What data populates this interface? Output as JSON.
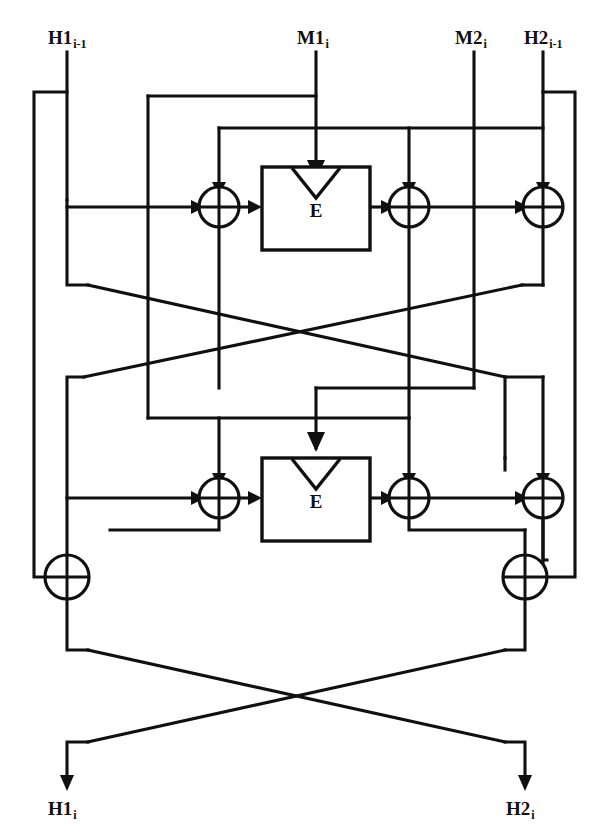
{
  "diagram": {
    "type": "block-diagram",
    "colors": {
      "line": "#101010",
      "background": "#ffffff"
    },
    "inputs": [
      {
        "id": "h1_in",
        "base": "H1",
        "subscript": "i-1",
        "x": 67
      },
      {
        "id": "m1_in",
        "base": "M1",
        "subscript": "i",
        "x": 316
      },
      {
        "id": "m2_in",
        "base": "M2",
        "subscript": "i",
        "x": 474
      },
      {
        "id": "h2_in",
        "base": "H2",
        "subscript": "i-1",
        "x": 543
      }
    ],
    "outputs": [
      {
        "id": "h1_out",
        "base": "H1",
        "subscript": "i",
        "x": 67
      },
      {
        "id": "h2_out",
        "base": "H2",
        "subscript": "i",
        "x": 525
      }
    ],
    "blocks": [
      {
        "id": "e-block-top",
        "label": "E",
        "x": 262,
        "y": 167,
        "w": 108,
        "h": 83
      },
      {
        "id": "e-block-bottom",
        "label": "E",
        "x": 262,
        "y": 458,
        "w": 108,
        "h": 83
      }
    ],
    "xor_gates": [
      {
        "id": "xor-top-left",
        "cx": 219,
        "cy": 207,
        "r": 20
      },
      {
        "id": "xor-top-mid",
        "cx": 409,
        "cy": 207,
        "r": 20
      },
      {
        "id": "xor-top-right",
        "cx": 543,
        "cy": 207,
        "r": 20
      },
      {
        "id": "xor-bottom-left",
        "cx": 219,
        "cy": 498,
        "r": 20
      },
      {
        "id": "xor-bottom-mid",
        "cx": 409,
        "cy": 498,
        "r": 20
      },
      {
        "id": "xor-bottom-right",
        "cx": 543,
        "cy": 498,
        "r": 20
      },
      {
        "id": "xor-final-left",
        "cx": 67,
        "cy": 577,
        "r": 22
      },
      {
        "id": "xor-final-right",
        "cx": 525,
        "cy": 577,
        "r": 22
      }
    ],
    "symbols": {
      "xor": "⊕",
      "encrypt": "E",
      "key_marker": "chevron-down"
    }
  }
}
